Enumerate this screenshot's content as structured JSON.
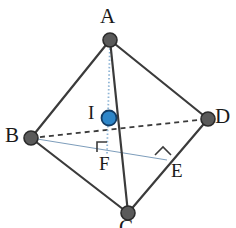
{
  "figure": {
    "background": "#ffffff",
    "width": 236,
    "height": 228
  },
  "style": {
    "edge_color": "#3b3b3b",
    "edge_width": 2.2,
    "hidden_edge_color": "#3b3b3b",
    "hidden_edge_width": 1.8,
    "hidden_dash": "5,4",
    "construction_color": "#7d9dbb",
    "construction_width": 1.0,
    "altitude_color": "#8fb5d6",
    "altitude_width": 1.6,
    "altitude_dash": "1.5,2",
    "vertex_fill": "#5a5a5a",
    "vertex_stroke": "#2b2b2b",
    "vertex_radius": 7,
    "incenter_fill": "#2e86c8",
    "incenter_stroke": "#123d66",
    "incenter_radius": 7.5,
    "right_angle_color": "#3b3b3b",
    "label_color": "#1a1a1a"
  },
  "points": {
    "A": {
      "label": "A",
      "x": 110,
      "y": 40,
      "label_x": 100,
      "label_y": 7,
      "kind": "vertex"
    },
    "B": {
      "label": "B",
      "x": 31,
      "y": 138,
      "label_x": 6,
      "label_y": 124,
      "kind": "vertex"
    },
    "C": {
      "label": "C",
      "x": 128,
      "y": 213,
      "label_x": 120,
      "label_y": 218,
      "kind": "vertex"
    },
    "D": {
      "label": "D",
      "x": 208,
      "y": 119,
      "label_x": 214,
      "label_y": 105,
      "kind": "vertex"
    },
    "I": {
      "label": "I",
      "x": 109,
      "y": 118,
      "label_x": 88,
      "label_y": 103,
      "kind": "incenter"
    },
    "E": {
      "label": "E",
      "x": 165,
      "y": 158,
      "label_x": 170,
      "label_y": 161,
      "kind": "foot"
    },
    "F": {
      "label": "F",
      "x": 107,
      "y": 152,
      "label_x": 99,
      "label_y": 155,
      "kind": "foot"
    }
  },
  "edges": [
    {
      "name": "edge-AB",
      "from": "A",
      "to": "B",
      "style": "solid"
    },
    {
      "name": "edge-AD",
      "from": "A",
      "to": "D",
      "style": "solid"
    },
    {
      "name": "edge-AC",
      "from": "A",
      "to": "C",
      "style": "solid"
    },
    {
      "name": "edge-BC",
      "from": "B",
      "to": "C",
      "style": "solid"
    },
    {
      "name": "edge-DC",
      "from": "D",
      "to": "C",
      "style": "solid"
    },
    {
      "name": "edge-BD",
      "from": "B",
      "to": "D",
      "style": "dashed-hidden"
    }
  ],
  "construction_lines": [
    {
      "name": "line-BE",
      "from": "B",
      "to": "E",
      "style": "thin-blue"
    },
    {
      "name": "altitude-AF",
      "from": "A",
      "to": "F",
      "style": "dotted-blue"
    }
  ],
  "right_angles": [
    {
      "name": "right-angle-F",
      "at": "F",
      "x": 98,
      "y": 141,
      "size": 10,
      "orientation": "up-left"
    },
    {
      "name": "right-angle-E",
      "at": "E",
      "x": 156,
      "y": 150,
      "size": 11,
      "orientation": "rotated"
    }
  ],
  "legend": {
    "description": "Tetrahedron ABCD with incenter I, foot of altitude F on base, and perpendicular foot E on edge DC"
  }
}
